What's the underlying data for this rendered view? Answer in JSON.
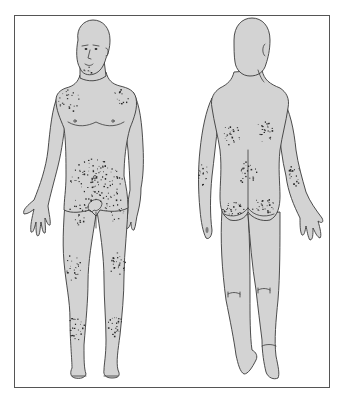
{
  "figure": {
    "colors": {
      "skin": "#d3d3d3",
      "outline": "#3a3a3a",
      "lesion": "#2a2a2a",
      "frame": "#555555",
      "background": "#ffffff"
    },
    "views": [
      {
        "name": "anterior",
        "lesion_regions": [
          {
            "region": "right-shoulder",
            "cx": 70,
            "cy": 100,
            "rx": 12,
            "ry": 12,
            "count": 22
          },
          {
            "region": "left-shoulder",
            "cx": 123,
            "cy": 96,
            "rx": 11,
            "ry": 8,
            "count": 14
          },
          {
            "region": "chin-beard",
            "cx": 88,
            "cy": 70,
            "rx": 5,
            "ry": 4,
            "count": 6
          },
          {
            "region": "lower-abdomen-groin",
            "cx": 96,
            "cy": 180,
            "rx": 26,
            "ry": 22,
            "count": 110
          },
          {
            "region": "inner-thigh-right",
            "cx": 78,
            "cy": 212,
            "rx": 9,
            "ry": 14,
            "count": 20
          },
          {
            "region": "inner-thigh-left",
            "cx": 114,
            "cy": 208,
            "rx": 10,
            "ry": 14,
            "count": 22
          },
          {
            "region": "right-knee",
            "cx": 73,
            "cy": 267,
            "rx": 8,
            "ry": 14,
            "count": 26
          },
          {
            "region": "left-knee",
            "cx": 117,
            "cy": 264,
            "rx": 8,
            "ry": 13,
            "count": 24
          },
          {
            "region": "right-shin",
            "cx": 76,
            "cy": 327,
            "rx": 8,
            "ry": 13,
            "count": 26
          },
          {
            "region": "left-shin",
            "cx": 114,
            "cy": 324,
            "rx": 8,
            "ry": 12,
            "count": 24
          }
        ]
      },
      {
        "name": "posterior",
        "lesion_regions": [
          {
            "region": "upper-back-left",
            "cx": 231,
            "cy": 135,
            "rx": 9,
            "ry": 11,
            "count": 26
          },
          {
            "region": "upper-back-right",
            "cx": 264,
            "cy": 132,
            "rx": 9,
            "ry": 11,
            "count": 26
          },
          {
            "region": "lower-back-sacral",
            "cx": 247,
            "cy": 172,
            "rx": 10,
            "ry": 12,
            "count": 24
          },
          {
            "region": "left-buttock",
            "cx": 233,
            "cy": 207,
            "rx": 12,
            "ry": 8,
            "count": 28
          },
          {
            "region": "right-buttock",
            "cx": 263,
            "cy": 206,
            "rx": 12,
            "ry": 8,
            "count": 28
          },
          {
            "region": "left-elbow",
            "cx": 203,
            "cy": 174,
            "rx": 5,
            "ry": 12,
            "count": 18
          },
          {
            "region": "right-elbow",
            "cx": 294,
            "cy": 175,
            "rx": 6,
            "ry": 13,
            "count": 20
          }
        ]
      }
    ]
  }
}
